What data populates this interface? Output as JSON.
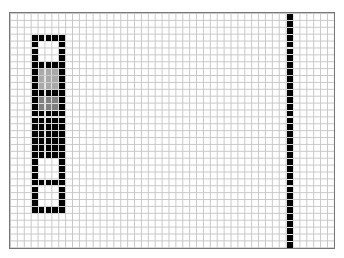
{
  "grid": {
    "cols": 47,
    "rows": 34,
    "cell_px": 6.9,
    "line_color": "#c8c8c8",
    "border_color": "#777777",
    "background": "#ffffff"
  },
  "palette": {
    "B": "#000000",
    "W": "#ffffff",
    "L": "#a9a9a9",
    "D": "#7f7f7f"
  },
  "shapes": [
    {
      "name": "segmented-block",
      "col": 3,
      "row": 3,
      "pattern": [
        "BBBBB",
        "BWWWB",
        "BWWWB",
        "BWWWB",
        "BBBBB",
        "BLLLB",
        "BLLLB",
        "BLLLB",
        "BBBBB",
        "BDDDB",
        "BDDDB",
        "BBBBB",
        "BBBBB",
        "BBBBB",
        "BBBBB",
        "BBBBB",
        "BBBBB",
        "BBBBB",
        "BWWWB",
        "BWWWB",
        "BWWWB",
        "BBBBB",
        "BWWWB",
        "BWWWB",
        "BWWWB",
        "BBBBB"
      ]
    },
    {
      "name": "vertical-bar",
      "col": 40,
      "row": 0,
      "width": 1,
      "height": 34,
      "fill": "B"
    }
  ]
}
